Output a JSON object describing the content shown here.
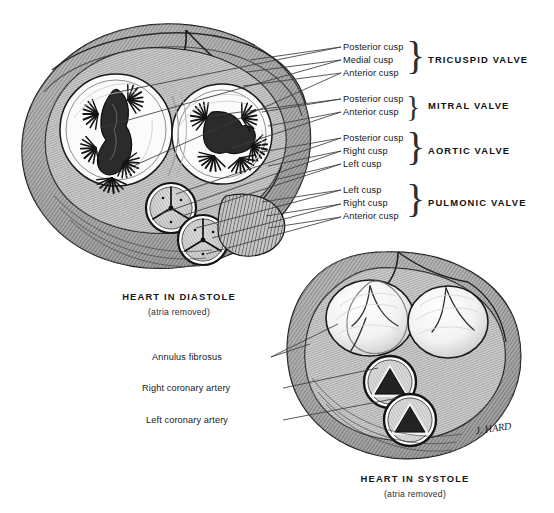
{
  "figure": {
    "kind": "anatomical-illustration",
    "style": "black-and-white pen-and-ink stipple/hatch drawing",
    "signature": "J. HARD"
  },
  "valve_groups": [
    {
      "id": "tricuspid",
      "name": "TRICUSPID VALVE",
      "cusps": [
        "Posterior cusp",
        "Medial cusp",
        "Anterior cusp"
      ]
    },
    {
      "id": "mitral",
      "name": "MITRAL VALVE",
      "cusps": [
        "Posterior cusp",
        "Anterior cusp"
      ]
    },
    {
      "id": "aortic",
      "name": "AORTIC VALVE",
      "cusps": [
        "Posterior cusp",
        "Right cusp",
        "Left cusp"
      ]
    },
    {
      "id": "pulmonic",
      "name": "PULMONIC VALVE",
      "cusps": [
        "Left cusp",
        "Right cusp",
        "Anterior cusp"
      ]
    }
  ],
  "systole_labels": [
    "Annulus fibrosus",
    "Right coronary artery",
    "Left coronary artery"
  ],
  "captions": {
    "diastole_title": "HEART IN DIASTOLE",
    "diastole_sub": "(atria removed)",
    "systole_title": "HEART IN SYSTOLE",
    "systole_sub": "(atria removed)"
  },
  "colors": {
    "background": "#ffffff",
    "border": "#b9b9b9",
    "ink": "#16181a",
    "leader": "#3a3c3e",
    "muscle_light": "#b9b9b9",
    "muscle_dark": "#3c3c3c",
    "orifice_dark": "#2a2a2a"
  }
}
